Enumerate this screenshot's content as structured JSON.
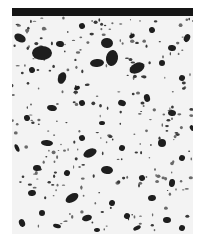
{
  "image": {
    "kind": "micrograph",
    "description": "Porous sintered metal cross-section with dark pores on light matrix",
    "colors": {
      "background": "#ffffff",
      "matrix": "#f3f3f3",
      "pore": "#1e1e1e",
      "surface_band": "#151515"
    },
    "surface_band": {
      "x": 0,
      "y": 0,
      "w": 181,
      "h": 8
    },
    "pores": [
      [
        8,
        30,
        6,
        4
      ],
      [
        30,
        45,
        10,
        7
      ],
      [
        48,
        36,
        4,
        3
      ],
      [
        70,
        18,
        3,
        3
      ],
      [
        95,
        35,
        6,
        5
      ],
      [
        120,
        28,
        3,
        2
      ],
      [
        140,
        22,
        3,
        3
      ],
      [
        160,
        40,
        4,
        3
      ],
      [
        175,
        30,
        3,
        4
      ],
      [
        50,
        70,
        4,
        6
      ],
      [
        85,
        55,
        7,
        4
      ],
      [
        100,
        50,
        6,
        8
      ],
      [
        125,
        60,
        8,
        5
      ],
      [
        150,
        55,
        3,
        3
      ],
      [
        20,
        62,
        3,
        3
      ],
      [
        65,
        80,
        3,
        2
      ],
      [
        170,
        70,
        3,
        3
      ],
      [
        40,
        100,
        5,
        3
      ],
      [
        70,
        95,
        3,
        3
      ],
      [
        110,
        95,
        4,
        3
      ],
      [
        135,
        90,
        3,
        4
      ],
      [
        160,
        105,
        4,
        3
      ],
      [
        15,
        110,
        3,
        3
      ],
      [
        90,
        115,
        3,
        2
      ],
      [
        35,
        135,
        6,
        3
      ],
      [
        70,
        130,
        3,
        3
      ],
      [
        78,
        145,
        7,
        4
      ],
      [
        110,
        140,
        3,
        3
      ],
      [
        150,
        135,
        4,
        4
      ],
      [
        170,
        150,
        3,
        3
      ],
      [
        25,
        160,
        4,
        3
      ],
      [
        55,
        165,
        3,
        3
      ],
      [
        95,
        162,
        6,
        4
      ],
      [
        130,
        170,
        3,
        3
      ],
      [
        160,
        175,
        3,
        4
      ],
      [
        20,
        185,
        4,
        3
      ],
      [
        60,
        190,
        7,
        4
      ],
      [
        100,
        195,
        3,
        3
      ],
      [
        140,
        190,
        4,
        3
      ],
      [
        30,
        205,
        3,
        3
      ],
      [
        75,
        210,
        5,
        3
      ],
      [
        115,
        208,
        3,
        3
      ],
      [
        155,
        212,
        4,
        3
      ],
      [
        10,
        215,
        3,
        4
      ],
      [
        45,
        218,
        4,
        2
      ],
      [
        85,
        222,
        3,
        2
      ],
      [
        125,
        220,
        4,
        2
      ],
      [
        170,
        220,
        3,
        3
      ],
      [
        5,
        140,
        2,
        4
      ],
      [
        180,
        120,
        2,
        3
      ]
    ]
  }
}
